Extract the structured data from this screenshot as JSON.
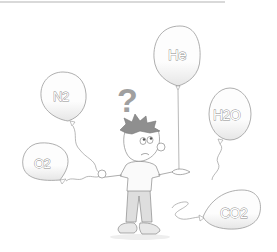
{
  "illustration": {
    "description": "Cartoon boy with a question mark above his head, surrounded by gas-labelled balloons",
    "question_mark": "?",
    "balloons": [
      {
        "id": "he",
        "label": "He",
        "state": "floating, held in right hand"
      },
      {
        "id": "n2",
        "label": "N2",
        "state": "floating, string to left hand"
      },
      {
        "id": "h2o",
        "label": "H2O",
        "state": "floating, loose string"
      },
      {
        "id": "o2",
        "label": "O2",
        "state": "low, string to left hand"
      },
      {
        "id": "co2",
        "label": "CO2",
        "state": "resting on ground"
      }
    ]
  },
  "colors": {
    "line": "#8a8a8a",
    "balloon_fill": "#fbfbfb",
    "balloon_shade": "#e8e8e8",
    "question_mark": "#9a9a9a",
    "hair": "#8c8c8c",
    "pants": "#dcdcdc",
    "shoes": "#e6e6e6"
  }
}
